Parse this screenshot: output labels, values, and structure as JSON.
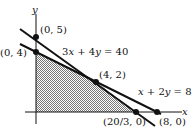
{
  "figure": {
    "axes": {
      "x_label": "x",
      "y_label": "y"
    },
    "lines": [
      {
        "equation": "3x + 4y = 40",
        "label_prefix": "3",
        "label_mid": " + 4",
        "label_rhs": " = 40"
      },
      {
        "equation": "x + 2y = 8",
        "label_mid": " + 2",
        "label_rhs": " = 8"
      }
    ],
    "points": [
      {
        "label": "(0, 5)",
        "x": 0,
        "y": 5
      },
      {
        "label": "(0, 4)",
        "x": 0,
        "y": 4
      },
      {
        "label": "(4, 2)",
        "x": 4,
        "y": 2
      },
      {
        "label": "(20/3, 0)",
        "x": 6.667,
        "y": 0
      },
      {
        "label": "(8, 0)",
        "x": 8,
        "y": 0
      }
    ],
    "shaded_region": "feasible region bounded by (0,0),(0,4),(4,2),(20/3,0)",
    "colors": {
      "ink": "#111111",
      "shade": "#bbbbbb"
    }
  }
}
